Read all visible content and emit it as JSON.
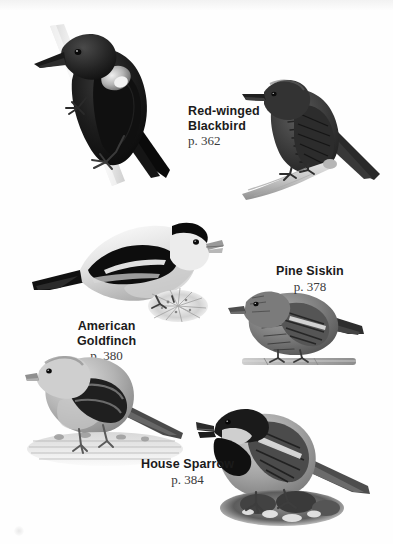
{
  "page": {
    "background_color": "#fefefe",
    "text_color": "#1b1b1b",
    "page_number_color": "#3a3a3a",
    "style": "grayscale bird field guide photo plate"
  },
  "entries": [
    {
      "id": "red-winged-blackbird",
      "name_line1": "Red-winged",
      "name_line2": "Blackbird",
      "page_ref": "p. 362",
      "label_align": "left",
      "photos": [
        {
          "id": "blackbird-male",
          "description": "male red-winged blackbird perched on pale diagonal stalk"
        },
        {
          "id": "blackbird-female",
          "description": "streaked female red-winged blackbird on light branch"
        }
      ]
    },
    {
      "id": "pine-siskin",
      "name_line1": "Pine Siskin",
      "name_line2": "",
      "page_ref": "p. 378",
      "label_align": "center",
      "photos": [
        {
          "id": "siskin",
          "description": "pine siskin facing left perched on thin twig"
        }
      ]
    },
    {
      "id": "american-goldfinch",
      "name_line1": "American",
      "name_line2": "Goldfinch",
      "page_ref": "p. 380",
      "label_align": "center",
      "photos": [
        {
          "id": "goldfinch-breeding",
          "description": "breeding goldfinch facing right on thistle seedhead"
        },
        {
          "id": "goldfinch-winter",
          "description": "winter goldfinch facing left on striped deck surface"
        }
      ]
    },
    {
      "id": "house-sparrow",
      "name_line1": "House Sparrow",
      "name_line2": "",
      "page_ref": "p. 384",
      "label_align": "center",
      "photos": [
        {
          "id": "house-sparrow",
          "description": "male house sparrow with dark bib standing on rocky ground"
        }
      ]
    }
  ]
}
